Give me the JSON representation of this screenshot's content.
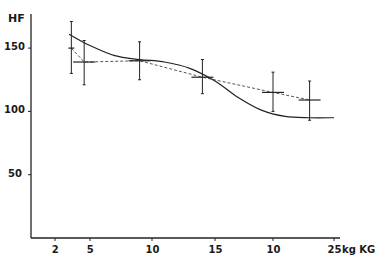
{
  "chart_data": {
    "type": "line",
    "title": "",
    "ylabel": "HF",
    "xlabel": "kg KG",
    "ylim": [
      0,
      175
    ],
    "yticks": [
      50,
      100,
      150
    ],
    "xtick_labels": [
      "2",
      "5",
      "10",
      "15",
      "10",
      "25"
    ],
    "xticks_kg": [
      2,
      5,
      10,
      15,
      20,
      25
    ],
    "x_unit_label": "kg KG",
    "grid": false,
    "legend": null,
    "series": [
      {
        "name": "measured mean (dashed, with error bars)",
        "style": "dashed",
        "x": [
          3.4,
          4.5,
          9.0,
          14.0,
          20.0,
          23.0
        ],
        "values": [
          150,
          139,
          140,
          127,
          115,
          109
        ],
        "error_high": [
          171,
          156,
          155,
          141,
          131,
          124
        ],
        "error_low": [
          130,
          121,
          125,
          114,
          100,
          93
        ]
      },
      {
        "name": "fitted curve (solid)",
        "style": "solid",
        "x": [
          3.2,
          5,
          7,
          9,
          11,
          13,
          15,
          17,
          19,
          21,
          23,
          25
        ],
        "values": [
          161,
          152,
          144,
          141,
          139,
          134,
          124,
          111,
          101,
          96,
          95,
          95
        ]
      }
    ]
  }
}
